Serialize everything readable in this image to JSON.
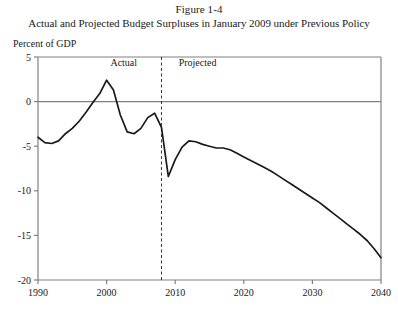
{
  "figure": {
    "number": "Figure 1-4",
    "title": "Actual and Projected Budget Surpluses in January 2009 under Previous Policy",
    "unit_label": "Percent of GDP"
  },
  "annotations": {
    "actual_label": "Actual",
    "projected_label": "Projected"
  },
  "colors": {
    "line": "#1a1a1a",
    "axis": "#808080",
    "zero_line": "#808080",
    "divider": "#333333",
    "background": "#ffffff"
  },
  "chart_data": {
    "type": "line",
    "title": "Actual and Projected Budget Surpluses in January 2009 under Previous Policy",
    "subtitle": "Figure 1-4",
    "xlabel": "",
    "ylabel": "Percent of GDP",
    "xlim": [
      1990,
      2040
    ],
    "ylim": [
      -20,
      5
    ],
    "xticks": [
      1990,
      2000,
      2010,
      2020,
      2030,
      2040
    ],
    "xticklabels": [
      "1990",
      "2000",
      "2010",
      "2020",
      "2030",
      "2040"
    ],
    "yticks": [
      5,
      0,
      -5,
      -10,
      -15,
      -20
    ],
    "yticklabels": [
      "5",
      "0",
      "-5",
      "-10",
      "-15",
      "-20"
    ],
    "grid": false,
    "legend": null,
    "zero_reference_line": 0,
    "divider_x": 2008,
    "annotations": [
      {
        "text": "Actual",
        "x": 2002.5,
        "y": 4.0
      },
      {
        "text": "Projected",
        "x": 2010.5,
        "y": 4.0
      }
    ],
    "series": [
      {
        "name": "Budget surplus as percent of GDP",
        "x": [
          1990,
          1991,
          1992,
          1993,
          1994,
          1995,
          1996,
          1997,
          1998,
          1999,
          2000,
          2001,
          2002,
          2003,
          2004,
          2005,
          2006,
          2007,
          2008,
          2009,
          2010,
          2011,
          2012,
          2013,
          2014,
          2015,
          2016,
          2017,
          2018,
          2019,
          2020,
          2021,
          2022,
          2023,
          2024,
          2025,
          2026,
          2027,
          2028,
          2029,
          2030,
          2031,
          2032,
          2033,
          2034,
          2035,
          2036,
          2037,
          2038,
          2039,
          2040
        ],
        "values": [
          -4.0,
          -4.6,
          -4.7,
          -4.4,
          -3.6,
          -3.0,
          -2.2,
          -1.2,
          -0.1,
          0.9,
          2.4,
          1.3,
          -1.5,
          -3.4,
          -3.6,
          -3.0,
          -1.8,
          -1.3,
          -2.9,
          -8.4,
          -6.5,
          -5.1,
          -4.4,
          -4.5,
          -4.8,
          -5.0,
          -5.2,
          -5.2,
          -5.4,
          -5.8,
          -6.2,
          -6.6,
          -7.0,
          -7.4,
          -7.8,
          -8.3,
          -8.8,
          -9.3,
          -9.8,
          -10.3,
          -10.8,
          -11.3,
          -11.9,
          -12.5,
          -13.1,
          -13.7,
          -14.3,
          -14.9,
          -15.6,
          -16.5,
          -17.5
        ]
      }
    ]
  }
}
